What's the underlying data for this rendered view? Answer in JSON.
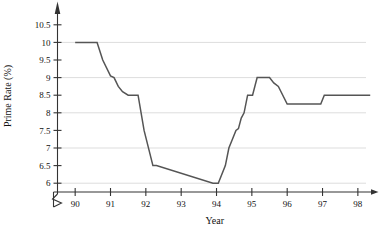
{
  "chart_data": {
    "type": "line",
    "title": "",
    "xlabel": "Year",
    "ylabel": "Prime Rate (%)",
    "xlim": [
      89.5,
      98.4
    ],
    "ylim": [
      5.75,
      10.75
    ],
    "yticks": [
      6,
      6.5,
      7,
      7.5,
      8,
      8.5,
      9,
      9.5,
      10,
      10.5
    ],
    "ytick_labels": [
      "6",
      "6.5",
      "7",
      "7.5",
      "8",
      "8.5",
      "9",
      "9.5",
      "10",
      "10.5"
    ],
    "xticks": [
      90,
      91,
      92,
      93,
      94,
      95,
      96,
      97,
      98
    ],
    "xtick_labels": [
      "90",
      "91",
      "92",
      "93",
      "94",
      "95",
      "96",
      "97",
      "98"
    ],
    "gridlines_y": [
      6,
      7,
      8,
      9,
      10
    ],
    "grid": true,
    "legend": null,
    "y_axis_break": true,
    "line_color": "#555555",
    "grid_color": "#dddddd",
    "axis_color": "#333333",
    "series": [
      {
        "name": "Prime Rate",
        "x": [
          90.0,
          90.62,
          90.78,
          91.0,
          91.1,
          91.22,
          91.34,
          91.5,
          91.78,
          91.95,
          92.2,
          92.3,
          93.9,
          94.05,
          94.25,
          94.35,
          94.45,
          94.55,
          94.62,
          94.7,
          94.78,
          94.88,
          95.02,
          95.15,
          95.25,
          95.5,
          95.62,
          95.75,
          96.0,
          96.95,
          97.05,
          98.35
        ],
        "y": [
          10.0,
          10.0,
          9.5,
          9.05,
          9.0,
          8.75,
          8.6,
          8.5,
          8.5,
          7.5,
          6.5,
          6.5,
          6.0,
          6.0,
          6.5,
          7.0,
          7.25,
          7.5,
          7.55,
          7.85,
          8.0,
          8.5,
          8.5,
          9.0,
          9.0,
          9.0,
          8.85,
          8.75,
          8.25,
          8.25,
          8.5,
          8.5
        ]
      }
    ]
  }
}
